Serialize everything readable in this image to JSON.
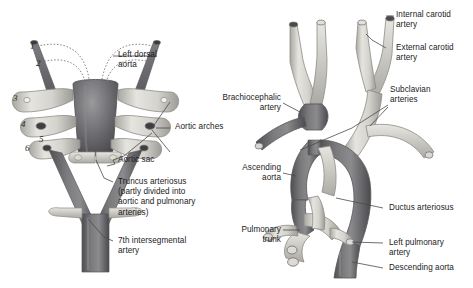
{
  "figure": {
    "background": "#ffffff",
    "text_color": "#1b1b1b",
    "leader_color": "#4a4a4a",
    "palette": {
      "dark_vessel": "#6f6f72",
      "dark_vessel_shadow": "#4d4d51",
      "light_vessel": "#d8d6d1",
      "light_vessel_shadow": "#a9a7a2",
      "mid_vessel": "#b6b4b0",
      "outline": "#6b6b6b",
      "lumen": "#3a3a3c"
    }
  },
  "left_panel": {
    "name": "embryonic-aortic-arch-system",
    "arch_numbers": [
      "1",
      "2",
      "3",
      "4",
      "5",
      "6"
    ],
    "labels": [
      {
        "id": "left-dorsal-aorta",
        "text": "Left dorsal\naorta"
      },
      {
        "id": "aortic-arches",
        "text": "Aortic arches"
      },
      {
        "id": "aortic-sac",
        "text": "Aortic sac"
      },
      {
        "id": "truncus-arteriosus",
        "text": "Truncus arteriosus\n(partly divided into\naortic and pulmonary\narteries)"
      },
      {
        "id": "seventh-intersegmental-artery",
        "text": "7th intersegmental\nartery"
      }
    ]
  },
  "right_panel": {
    "name": "adult-aortic-arch-derivatives",
    "labels_right": [
      {
        "id": "internal-carotid-artery",
        "text": "Internal carotid\nartery"
      },
      {
        "id": "external-carotid-artery",
        "text": "External carotid\nartery"
      },
      {
        "id": "subclavian-arteries",
        "text": "Subclavian\narteries"
      },
      {
        "id": "ductus-arteriosus",
        "text": "Ductus arteriosus"
      },
      {
        "id": "left-pulmonary-artery",
        "text": "Left pulmonary\nartery"
      },
      {
        "id": "descending-aorta",
        "text": "Descending aorta"
      }
    ],
    "labels_left": [
      {
        "id": "brachiocephalic-artery",
        "text": "Brachiocephalic\nartery"
      },
      {
        "id": "ascending-aorta",
        "text": "Ascending\naorta"
      },
      {
        "id": "pulmonary-trunk",
        "text": "Pulmonary\ntrunk"
      }
    ]
  }
}
